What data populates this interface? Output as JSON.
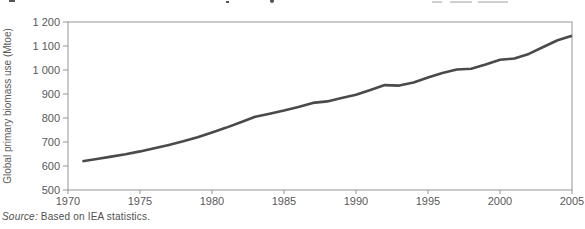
{
  "chart_data": {
    "type": "line",
    "title": "",
    "ylabel": "Global primary biomass use (Mtoe)",
    "xlabel": "",
    "xlim": [
      1970,
      2005
    ],
    "ylim": [
      500,
      1200
    ],
    "x_ticks": [
      1970,
      1975,
      1980,
      1985,
      1990,
      1995,
      2000,
      2005
    ],
    "y_ticks": [
      {
        "label": "1 200",
        "value": 1200
      },
      {
        "label": "1 100",
        "value": 1100
      },
      {
        "label": "1 000",
        "value": 1000
      },
      {
        "label": "900",
        "value": 900
      },
      {
        "label": "800",
        "value": 800
      },
      {
        "label": "700",
        "value": 700
      },
      {
        "label": "600",
        "value": 600
      },
      {
        "label": "500",
        "value": 500
      }
    ],
    "grid": false,
    "legend": "none",
    "line_color": "#4a4a4a",
    "axis_color": "#949494",
    "text_color": "#595959",
    "series": [
      {
        "name": "Global primary biomass use (Mtoe)",
        "x": [
          1971,
          1972,
          1973,
          1974,
          1975,
          1976,
          1977,
          1978,
          1979,
          1980,
          1981,
          1982,
          1983,
          1984,
          1985,
          1986,
          1987,
          1988,
          1989,
          1990,
          1991,
          1992,
          1993,
          1994,
          1995,
          1996,
          1997,
          1998,
          1999,
          2000,
          2001,
          2002,
          2003,
          2004,
          2005
        ],
        "values": [
          620,
          629,
          639,
          649,
          661,
          674,
          688,
          703,
          720,
          740,
          760,
          782,
          805,
          818,
          831,
          846,
          863,
          869,
          883,
          897,
          917,
          937,
          935,
          948,
          969,
          988,
          1002,
          1005,
          1023,
          1043,
          1048,
          1067,
          1096,
          1124,
          1143
        ]
      }
    ]
  },
  "source_note": {
    "prefix": "Source:",
    "text": "Based on IEA statistics."
  }
}
